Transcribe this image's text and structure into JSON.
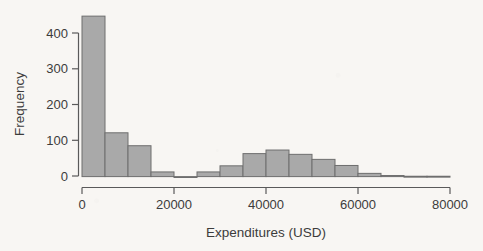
{
  "figure": {
    "background_color": "#f8f6f3",
    "bar_fill_color": "#a9a9a9",
    "bar_edge_color": "#6e6e6e",
    "axis_color": "#5a5a5a",
    "text_color": "#3c3c3c"
  },
  "chart_data": {
    "type": "bar",
    "title": "",
    "subtitle": "",
    "xlabel": "Expenditures (USD)",
    "ylabel": "Frequency",
    "grid": false,
    "legend": null,
    "legend_position": "none",
    "xlim": [
      0,
      82000
    ],
    "ylim": [
      0,
      455
    ],
    "xticks": [
      0,
      20000,
      40000,
      60000,
      80000
    ],
    "xtick_labels": [
      "0",
      "20000",
      "40000",
      "60000",
      "80000"
    ],
    "yticks": [
      0,
      100,
      200,
      300,
      400
    ],
    "ytick_labels": [
      "0",
      "100",
      "200",
      "300",
      "400"
    ],
    "bin_width": 5000,
    "bin_edges": [
      0,
      5000,
      10000,
      15000,
      20000,
      25000,
      30000,
      35000,
      40000,
      45000,
      50000,
      55000,
      60000,
      65000,
      70000,
      75000,
      80000
    ],
    "bin_centers": [
      2500,
      7500,
      12500,
      17500,
      22500,
      27500,
      32500,
      37500,
      42500,
      47500,
      52500,
      57500,
      62500,
      67500,
      72500,
      77500
    ],
    "categories": [
      "0-5000",
      "5000-10000",
      "10000-15000",
      "15000-20000",
      "20000-25000",
      "25000-30000",
      "30000-35000",
      "35000-40000",
      "40000-45000",
      "45000-50000",
      "50000-55000",
      "55000-60000",
      "60000-65000",
      "65000-70000",
      "70000-75000",
      "75000-80000"
    ],
    "values": [
      447,
      122,
      86,
      13,
      0,
      13,
      30,
      64,
      74,
      62,
      48,
      31,
      9,
      3,
      1,
      1
    ]
  }
}
